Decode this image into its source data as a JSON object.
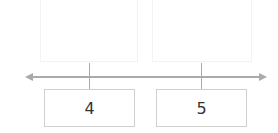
{
  "number_line": {
    "axis_color": "#aaaaaa",
    "marks": [
      {
        "label": "4"
      },
      {
        "label": "5"
      }
    ]
  }
}
